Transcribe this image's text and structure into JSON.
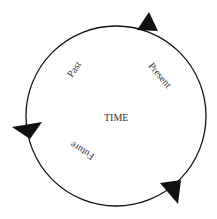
{
  "diagram": {
    "center_label": "TIME",
    "labels": {
      "past": "Past",
      "present": "Present",
      "future": "Future"
    },
    "colors": {
      "stroke": "#111111",
      "arrow": "#111111",
      "text": "#333333"
    }
  }
}
